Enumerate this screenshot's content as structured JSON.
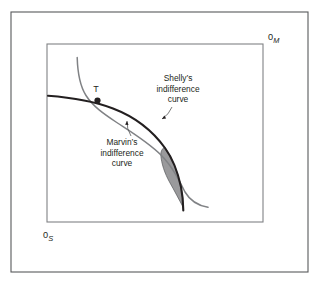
{
  "figure": {
    "type": "edgeworth-box-diagram",
    "background_color": "#ffffff",
    "outer_frame": {
      "stroke": "#58595b",
      "x": 11,
      "y": 12,
      "width": 297,
      "height": 260
    },
    "inner_box": {
      "stroke": "#808285",
      "x": 47,
      "y": 44,
      "width": 216,
      "height": 178
    }
  },
  "origins": {
    "marvin": {
      "num": "0",
      "sub": "M",
      "x": 268,
      "y": 40
    },
    "shelly": {
      "num": "0",
      "sub": "S",
      "x": 43,
      "y": 238
    }
  },
  "point": {
    "label": "T",
    "x": 97.5,
    "y": 100.5,
    "label_x": 96,
    "label_y": 92,
    "color": "#231f20",
    "radius": 3.1
  },
  "annotations": [
    {
      "name": "shelly-label",
      "lines": [
        "Shelly’s",
        "indifference",
        "curve"
      ],
      "anchor_x": 178,
      "first_line_y": 81,
      "line_height": 10.6,
      "leader": {
        "from_x": 172,
        "from_y": 107,
        "to_x": 162,
        "to_y": 119
      }
    },
    {
      "name": "marvin-label",
      "lines": [
        "Marvin’s",
        "indifference",
        "curve"
      ],
      "anchor_x": 122,
      "first_line_y": 145,
      "line_height": 10.6,
      "leader": {
        "from_x": 131,
        "from_y": 136,
        "to_x": 127,
        "to_y": 121
      }
    }
  ],
  "curves": [
    {
      "name": "marvin-indifference-curve",
      "color": "#231f20",
      "width": 2.1,
      "description": "Marvin's indifference curve: convex to the 0S origin, bowed away from lower-left, steeply falling to a near-vertical drop at the right.",
      "path": "M 48,95.8 C 70,97.5 92,100.5 113,108.5 C 134,116.5 152,130 165,148 C 173,159 178,173 181,187 C 182.6,195 183.2,203 183.3,210.5"
    },
    {
      "name": "shelly-indifference-curve",
      "color": "#808285",
      "width": 1.5,
      "description": "Shelly's indifference curve: convex to the 0M origin, starting near-vertical at top-left, flattening toward the lower-right.",
      "path": "M 77.2,57.5 C 77.6,72 80,86 86,95.5 C 93,106.5 104,114 116,122 C 132,132.5 148,142 161,155 C 172,166 179,180 185,192 C 190,200.5 197,205.5 208,207.3"
    }
  ],
  "shaded_region": {
    "name": "gains-from-trade-lens",
    "fill": "#9a9a9c",
    "stroke": "#58595b",
    "opacity": 1,
    "description": "Lens-shaped shaded area of mutually beneficial trades between the two indifference curves.",
    "path": "M 164.6,147.0 C 172.5,158.0 177.6,172.0 180.8,186.0 C 182.2,193.0 183.0,201.0 183.3,207.5 C 179.0,199.5 174.6,191.0 169.5,182.0 C 164.8,173.5 161.3,163.5 160.8,154.8 C 160.6,151.5 162.2,148.6 164.6,147.0 Z"
  },
  "colors": {
    "ink": "#231f20",
    "gray_curve": "#808285",
    "frame": "#58595b",
    "shade": "#9a9a9c",
    "page": "#ffffff"
  }
}
